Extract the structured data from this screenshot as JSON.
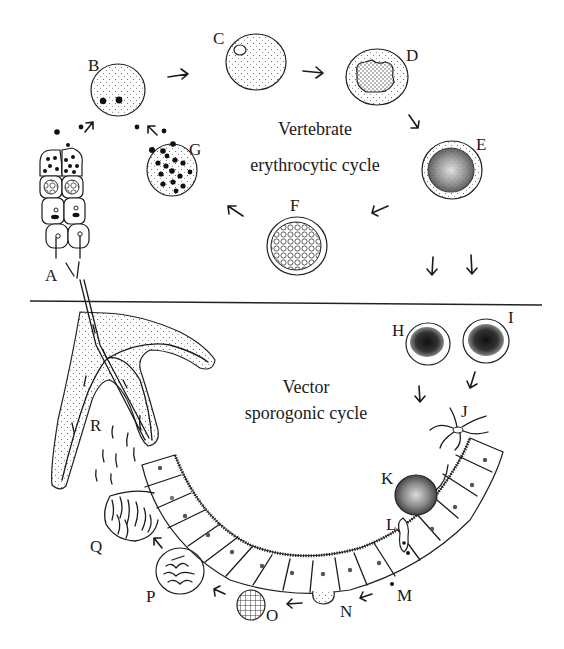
{
  "diagram": {
    "cycles": {
      "vertebrate": {
        "line1": "Vertebrate",
        "line2": "erythrocytic cycle"
      },
      "vector": {
        "line1": "Vector",
        "line2": "sporogonic cycle"
      }
    },
    "stage_labels": {
      "A": "A",
      "B": "B",
      "C": "C",
      "D": "D",
      "E": "E",
      "F": "F",
      "G": "G",
      "H": "H",
      "I": "I",
      "J": "J",
      "K": "K",
      "L": "L",
      "M": "M",
      "N": "N",
      "O": "O",
      "P": "P",
      "Q": "Q",
      "R": "R"
    },
    "colors": {
      "ink": "#1a1a1a",
      "background": "#ffffff"
    }
  }
}
